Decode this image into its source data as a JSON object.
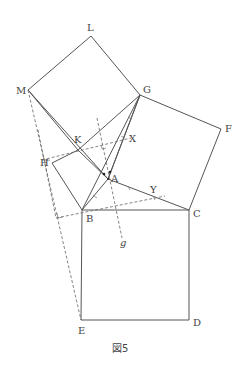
{
  "figure": {
    "caption": "図5",
    "points": {
      "L": {
        "label": "L",
        "x": 91,
        "y": 36
      },
      "M": {
        "label": "M",
        "x": 28,
        "y": 90
      },
      "G": {
        "label": "G",
        "x": 140,
        "y": 95
      },
      "F": {
        "label": "F",
        "x": 221,
        "y": 129
      },
      "K": {
        "label": "K",
        "x": 78,
        "y": 150
      },
      "X": {
        "label": "X",
        "x": 131,
        "y": 138
      },
      "H": {
        "label": "H",
        "x": 52,
        "y": 163
      },
      "A": {
        "label": "A",
        "x": 108,
        "y": 179
      },
      "Y": {
        "label": "Y",
        "x": 165,
        "y": 196
      },
      "B": {
        "label": "B",
        "x": 82,
        "y": 210
      },
      "C": {
        "label": "C",
        "x": 189,
        "y": 210
      },
      "E": {
        "label": "E",
        "x": 81,
        "y": 320
      },
      "D": {
        "label": "D",
        "x": 189,
        "y": 320
      }
    },
    "line_label": "g",
    "squares": [
      "LMKG",
      "GFCA",
      "BCDE",
      "KABH"
    ]
  }
}
